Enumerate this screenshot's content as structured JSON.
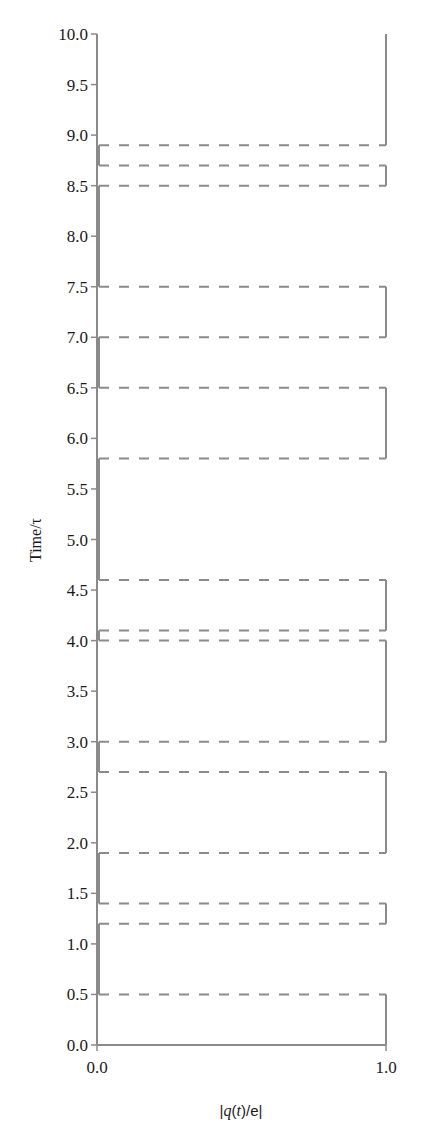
{
  "chart_data": {
    "type": "line",
    "subtype": "step",
    "title": "",
    "xlabel": "|q(t)/e|",
    "ylabel": "Time/τ",
    "xlim": [
      0.0,
      1.0
    ],
    "ylim": [
      0.0,
      10.0
    ],
    "x_ticks": [
      "0.0",
      "1.0"
    ],
    "y_ticks": [
      "0.0",
      "0.5",
      "1.0",
      "1.5",
      "2.0",
      "2.5",
      "3.0",
      "3.5",
      "4.0",
      "4.5",
      "5.0",
      "5.5",
      "6.0",
      "6.5",
      "7.0",
      "7.5",
      "8.0",
      "8.5",
      "9.0",
      "9.5",
      "10.0"
    ],
    "grid": false,
    "legend": null,
    "line_color": "#8a8a8a",
    "axis_color": "#8a8a8a",
    "transition_style": "dashed",
    "series": [
      {
        "name": "|q(t)/e|",
        "description": "Telegraph signal switching between |q|=0 and |q|=1; horizontal dashed lines mark jump times",
        "intervals_q1": [
          [
            0.0,
            0.5
          ],
          [
            1.2,
            1.4
          ],
          [
            1.9,
            2.7
          ],
          [
            3.0,
            4.0
          ],
          [
            4.1,
            4.6
          ],
          [
            5.8,
            6.5
          ],
          [
            7.0,
            7.5
          ],
          [
            8.5,
            8.7
          ],
          [
            8.9,
            10.0
          ]
        ],
        "intervals_q0": [
          [
            0.5,
            1.2
          ],
          [
            1.4,
            1.9
          ],
          [
            2.7,
            3.0
          ],
          [
            4.0,
            4.1
          ],
          [
            4.6,
            5.8
          ],
          [
            6.5,
            7.0
          ],
          [
            7.5,
            8.5
          ],
          [
            8.7,
            8.9
          ]
        ],
        "jump_times": [
          0.5,
          1.2,
          1.4,
          1.9,
          2.7,
          3.0,
          4.0,
          4.1,
          4.6,
          5.8,
          6.5,
          7.0,
          7.5,
          8.5,
          8.7,
          8.9
        ]
      }
    ]
  }
}
